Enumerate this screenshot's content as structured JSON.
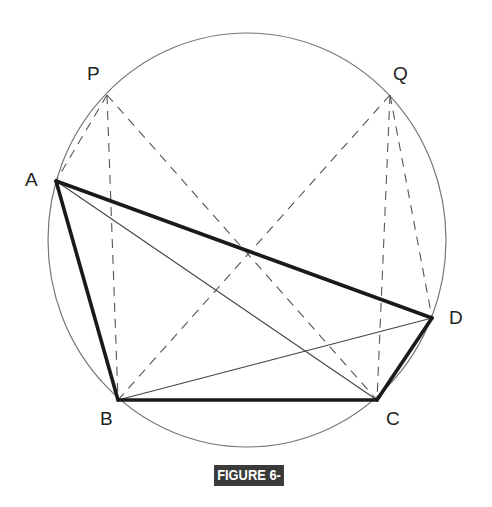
{
  "figure": {
    "caption": "FIGURE 6-15"
  },
  "circle": {
    "cx": 247,
    "cy": 240,
    "rx": 199,
    "ry": 207,
    "color": "#777777"
  },
  "points": {
    "P": {
      "label": "P",
      "x": 107,
      "y": 95,
      "lx": 87,
      "ly": 80
    },
    "Q": {
      "label": "Q",
      "x": 390,
      "y": 95,
      "lx": 393,
      "ly": 80
    },
    "A": {
      "label": "A",
      "x": 56,
      "y": 181,
      "lx": 25,
      "ly": 186
    },
    "B": {
      "label": "B",
      "x": 118,
      "y": 400,
      "lx": 100,
      "ly": 425
    },
    "C": {
      "label": "C",
      "x": 377,
      "y": 400,
      "lx": 386,
      "ly": 425
    },
    "D": {
      "label": "D",
      "x": 432,
      "y": 318,
      "lx": 449,
      "ly": 324
    }
  },
  "segments": {
    "thick": [
      [
        "A",
        "B"
      ],
      [
        "B",
        "C"
      ],
      [
        "C",
        "D"
      ],
      [
        "A",
        "D"
      ]
    ],
    "thin": [
      [
        "A",
        "C"
      ],
      [
        "B",
        "D"
      ]
    ],
    "dashed": [
      [
        "P",
        "A"
      ],
      [
        "P",
        "B"
      ],
      [
        "P",
        "C"
      ],
      [
        "Q",
        "B"
      ],
      [
        "Q",
        "C"
      ],
      [
        "Q",
        "D"
      ]
    ]
  },
  "colors": {
    "stroke": "#1a1a1a",
    "caption_bg": "#3a3a3a",
    "caption_text": "#ffffff"
  }
}
